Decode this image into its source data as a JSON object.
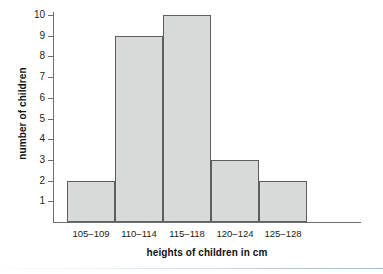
{
  "chart_data": {
    "type": "bar",
    "title": "",
    "subtitle": "",
    "xlabel": "heights of children in cm",
    "ylabel": "number of children",
    "categories": [
      "105–109",
      "110–114",
      "115–118",
      "120–124",
      "125–128"
    ],
    "values": [
      2,
      9,
      10,
      3,
      2
    ],
    "ylim": [
      0,
      10
    ],
    "yticks": [
      1,
      2,
      3,
      4,
      5,
      6,
      7,
      8,
      9,
      10
    ],
    "ytick_labels": [
      "1",
      "2",
      "3",
      "4",
      "5",
      "6",
      "7",
      "8",
      "9",
      "10"
    ],
    "grid": false,
    "legend": null,
    "bar_fill_color": "#d8dad9",
    "bar_border_color": "#5d5f5e",
    "axis_color": "#6d6f6e",
    "text_color": "#1c1c1c",
    "background_color": "#ffffff",
    "accent_rule_color": "#a8cadd",
    "bars_adjacent": true
  }
}
